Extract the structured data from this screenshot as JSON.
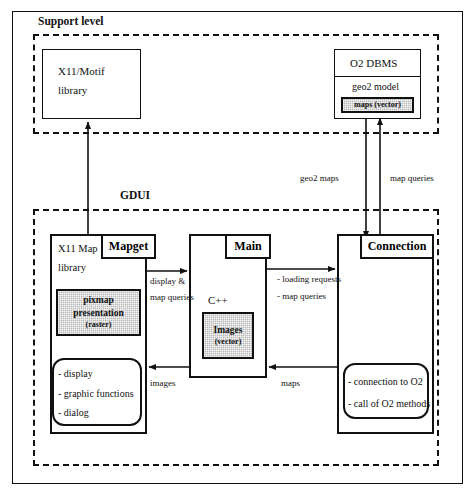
{
  "diagram": {
    "regions": {
      "support_level": {
        "label": "Support level"
      },
      "gdui": {
        "label": "GDUI"
      }
    },
    "support_boxes": {
      "x11_motif": {
        "line1": "X11/Motif",
        "line2": "library"
      },
      "o2_dbms": {
        "header": "O2 DBMS",
        "model": "geo2 model",
        "shaded": "maps (vector)"
      }
    },
    "gdui_boxes": {
      "x11_map": {
        "tab": "Mapget",
        "line1": "X11 Map",
        "line2": "library",
        "shaded_line1": "pixmap",
        "shaded_line2": "presentation",
        "shaded_line3": "(raster)",
        "bullets": [
          "- display",
          "- graphic functions",
          "- dialog"
        ]
      },
      "main": {
        "tab": "Main",
        "language": "C++",
        "shaded_line1": "Images",
        "shaded_line2": "(vector)"
      },
      "connection": {
        "tab": "Connection",
        "bullets": [
          "- connection to O2",
          "- call of O2 methods"
        ]
      }
    },
    "edge_labels": {
      "geo2_maps": "geo2 maps",
      "map_queries_vertical": "map queries",
      "display_and": "display &",
      "map_queries_left": "map queries",
      "loading_requests": "- loading requests",
      "map_queries_right": "- map queries",
      "images": "images",
      "maps": "maps"
    },
    "colors": {
      "ink": "#111111",
      "paper": "#ffffff",
      "shade": "#b9b9b9"
    }
  }
}
